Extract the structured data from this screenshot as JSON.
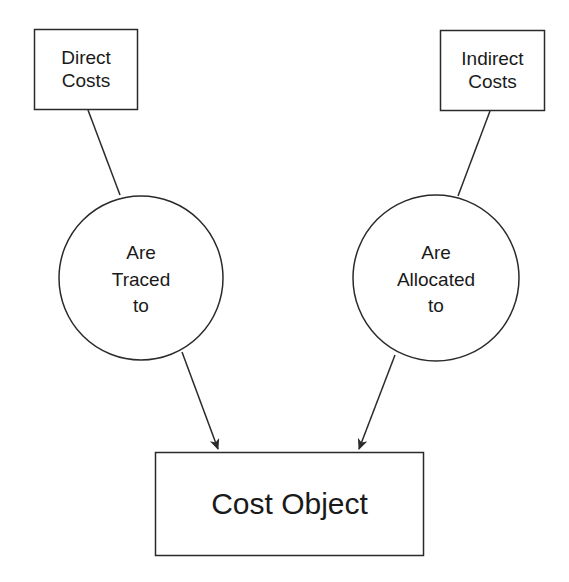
{
  "diagram": {
    "colors": {
      "stroke": "#2a2a2a",
      "background": "#ffffff",
      "text": "#1a1a1a"
    },
    "nodes": {
      "direct_costs": {
        "shape": "rectangle",
        "lines": [
          "Direct",
          "Costs"
        ]
      },
      "indirect_costs": {
        "shape": "rectangle",
        "lines": [
          "Indirect",
          "Costs"
        ]
      },
      "are_traced_to": {
        "shape": "circle",
        "lines": [
          "Are",
          "Traced",
          "to"
        ]
      },
      "are_allocated_to": {
        "shape": "circle",
        "lines": [
          "Are",
          "Allocated",
          "to"
        ]
      },
      "cost_object": {
        "shape": "rectangle",
        "label": "Cost Object"
      }
    },
    "edges": [
      {
        "from": "direct_costs",
        "to": "are_traced_to",
        "arrow": false
      },
      {
        "from": "indirect_costs",
        "to": "are_allocated_to",
        "arrow": false
      },
      {
        "from": "are_traced_to",
        "to": "cost_object",
        "arrow": true
      },
      {
        "from": "are_allocated_to",
        "to": "cost_object",
        "arrow": true
      }
    ]
  }
}
